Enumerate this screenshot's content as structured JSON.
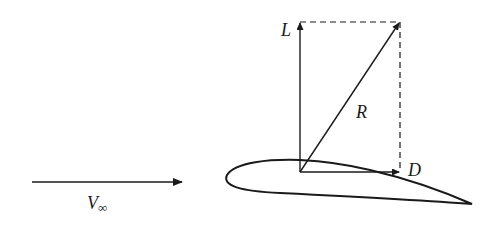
{
  "diagram": {
    "labels": {
      "lift": "L",
      "resultant": "R",
      "drag": "D",
      "freestream": "V",
      "freestream_sub": "∞"
    },
    "colors": {
      "stroke": "#1a1a1a",
      "background": "#ffffff"
    }
  }
}
